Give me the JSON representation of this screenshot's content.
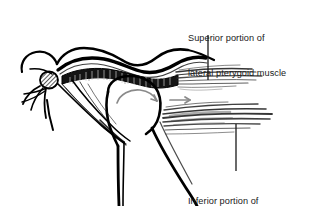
{
  "figure": {
    "name": "lateral-pterygoid-muscle-diagram",
    "background_color": "#ffffff",
    "ink_color": "#000000",
    "arrow_color": "#8a8a8a",
    "width": 311,
    "height": 206
  },
  "labels": {
    "superior": {
      "line1": "Superior portion of",
      "line2": "lateral pterygoid muscle"
    },
    "inferior": {
      "line1": "Inferior portion of",
      "line2": "lateral pterygoid muscle"
    }
  },
  "annotations": {
    "rotation_arrow": "curved-rotation-arrow",
    "translation_arrow": "straight-translation-arrow",
    "leader_superior": "leader-line-superior",
    "leader_inferior": "leader-line-inferior"
  },
  "structures": {
    "condyle": "mandibular-condyle",
    "disc": "articular-disc",
    "superior_belly": "superior-lateral-pterygoid-belly",
    "inferior_belly": "inferior-lateral-pterygoid-belly",
    "ramus": "mandibular-ramus",
    "coronoid": "coronoid-process"
  }
}
